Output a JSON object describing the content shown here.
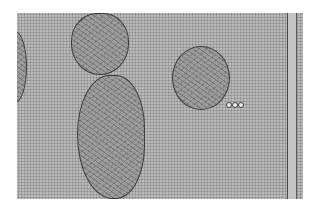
{
  "image": {
    "type": "electron micrograph",
    "description": "Transmission electron micrograph showing mitochondria among a hexagonal lattice of myofilaments (cross-section of muscle), with a membrane boundary at right",
    "colors": {
      "background": "#ffffff",
      "lattice": "#b9b9b9",
      "organelle_border": "#3a3a3a"
    }
  }
}
